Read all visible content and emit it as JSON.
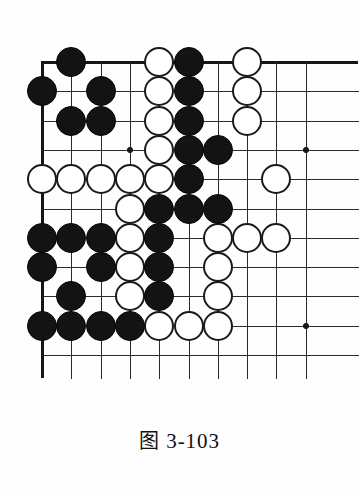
{
  "figure": {
    "caption_prefix": "图",
    "caption_number": "3-103",
    "caption_full": "图 3-103",
    "type": "go-board-diagram"
  },
  "board": {
    "colors": {
      "line": "#2b2b2b",
      "edge": "#161616",
      "black_stone": "#131313",
      "white_stone": "#ffffff",
      "white_stone_border": "#1a1a1a",
      "background": "#fefefe"
    },
    "geometry": {
      "origin_x": 42,
      "origin_y": 62,
      "spacing": 29.3,
      "columns": 10,
      "rows": 11,
      "stone_diameter": 30
    },
    "edges": {
      "top": true,
      "left": true,
      "right": false,
      "bottom": false
    },
    "star_points": [
      {
        "col": 4,
        "row": 4
      },
      {
        "col": 10,
        "row": 4
      },
      {
        "col": 10,
        "row": 10
      }
    ],
    "stones": [
      {
        "col": 2,
        "row": 1,
        "color": "black"
      },
      {
        "col": 5,
        "row": 1,
        "color": "white"
      },
      {
        "col": 6,
        "row": 1,
        "color": "black"
      },
      {
        "col": 8,
        "row": 1,
        "color": "white"
      },
      {
        "col": 1,
        "row": 2,
        "color": "black"
      },
      {
        "col": 3,
        "row": 2,
        "color": "black"
      },
      {
        "col": 5,
        "row": 2,
        "color": "white"
      },
      {
        "col": 6,
        "row": 2,
        "color": "black"
      },
      {
        "col": 8,
        "row": 2,
        "color": "white"
      },
      {
        "col": 2,
        "row": 3,
        "color": "black"
      },
      {
        "col": 3,
        "row": 3,
        "color": "black"
      },
      {
        "col": 5,
        "row": 3,
        "color": "white"
      },
      {
        "col": 6,
        "row": 3,
        "color": "black"
      },
      {
        "col": 8,
        "row": 3,
        "color": "white"
      },
      {
        "col": 5,
        "row": 4,
        "color": "white"
      },
      {
        "col": 6,
        "row": 4,
        "color": "black"
      },
      {
        "col": 7,
        "row": 4,
        "color": "black"
      },
      {
        "col": 1,
        "row": 5,
        "color": "white"
      },
      {
        "col": 2,
        "row": 5,
        "color": "white"
      },
      {
        "col": 3,
        "row": 5,
        "color": "white"
      },
      {
        "col": 4,
        "row": 5,
        "color": "white"
      },
      {
        "col": 5,
        "row": 5,
        "color": "white"
      },
      {
        "col": 6,
        "row": 5,
        "color": "black"
      },
      {
        "col": 9,
        "row": 5,
        "color": "white"
      },
      {
        "col": 4,
        "row": 6,
        "color": "white"
      },
      {
        "col": 5,
        "row": 6,
        "color": "black"
      },
      {
        "col": 6,
        "row": 6,
        "color": "black"
      },
      {
        "col": 7,
        "row": 6,
        "color": "black"
      },
      {
        "col": 1,
        "row": 7,
        "color": "black"
      },
      {
        "col": 2,
        "row": 7,
        "color": "black"
      },
      {
        "col": 3,
        "row": 7,
        "color": "black"
      },
      {
        "col": 4,
        "row": 7,
        "color": "white"
      },
      {
        "col": 5,
        "row": 7,
        "color": "black"
      },
      {
        "col": 7,
        "row": 7,
        "color": "white"
      },
      {
        "col": 8,
        "row": 7,
        "color": "white"
      },
      {
        "col": 9,
        "row": 7,
        "color": "white"
      },
      {
        "col": 1,
        "row": 8,
        "color": "black"
      },
      {
        "col": 3,
        "row": 8,
        "color": "black"
      },
      {
        "col": 4,
        "row": 8,
        "color": "white"
      },
      {
        "col": 5,
        "row": 8,
        "color": "black"
      },
      {
        "col": 7,
        "row": 8,
        "color": "white"
      },
      {
        "col": 2,
        "row": 9,
        "color": "black"
      },
      {
        "col": 4,
        "row": 9,
        "color": "white"
      },
      {
        "col": 5,
        "row": 9,
        "color": "black"
      },
      {
        "col": 7,
        "row": 9,
        "color": "white"
      },
      {
        "col": 1,
        "row": 10,
        "color": "black"
      },
      {
        "col": 2,
        "row": 10,
        "color": "black"
      },
      {
        "col": 3,
        "row": 10,
        "color": "black"
      },
      {
        "col": 4,
        "row": 10,
        "color": "black"
      },
      {
        "col": 5,
        "row": 10,
        "color": "white"
      },
      {
        "col": 6,
        "row": 10,
        "color": "white"
      },
      {
        "col": 7,
        "row": 10,
        "color": "white"
      }
    ]
  }
}
